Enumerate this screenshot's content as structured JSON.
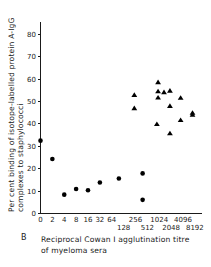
{
  "panel": {
    "label": "B"
  },
  "chart_data": {
    "type": "scatter",
    "title": "",
    "panel_label": "B",
    "xlabel": "Reciprocal Cowan I agglutination titre of myeloma sera",
    "xlabel_line1": "Reciprocal Cowan I agglutination titre",
    "xlabel_line2": "of myeloma sera",
    "ylabel": "Per cent binding of isotope-labelled protein A-IgG complexes to staphylococci",
    "ylabel_line1": "Per cent binding of isotope-labelled protein A-IgG",
    "ylabel_line2": "complexes to staphylococci",
    "grid": false,
    "legend": "none",
    "ylim": [
      0,
      85
    ],
    "yticks": [
      0,
      10,
      20,
      30,
      40,
      50,
      60,
      70,
      80
    ],
    "ytick_labels": [
      "0",
      "10",
      "20",
      "30",
      "40",
      "50",
      "60",
      "70",
      "80"
    ],
    "x_scale": "log2-category",
    "xticks_index": [
      0,
      1,
      2,
      3,
      4,
      5,
      6,
      7,
      8,
      9,
      10,
      11,
      12,
      13
    ],
    "xtick_labels": [
      "0",
      "2",
      "4",
      "8",
      "16",
      "32",
      "64",
      "128",
      "256",
      "512",
      "1024",
      "2048",
      "4096",
      "8192"
    ],
    "xtick_rows": [
      "top",
      "top",
      "top",
      "top",
      "top",
      "top",
      "top",
      "bottom",
      "top",
      "bottom",
      "top",
      "bottom",
      "top",
      "bottom"
    ],
    "marker_colors": {
      "circle": "#000000",
      "triangle": "#000000"
    },
    "series": [
      {
        "name": "circles",
        "marker": "circle",
        "values": [
          {
            "x_index": 0,
            "x_label": "0",
            "y": 32.5
          },
          {
            "x_index": 1,
            "x_label": "2",
            "y": 24.3
          },
          {
            "x_index": 2,
            "x_label": "4",
            "y": 8.4
          },
          {
            "x_index": 3,
            "x_label": "8",
            "y": 10.9
          },
          {
            "x_index": 4,
            "x_label": "16",
            "y": 10.4
          },
          {
            "x_index": 5,
            "x_label": "32",
            "y": 13.8
          },
          {
            "x_index": 6.6,
            "x_label": "128",
            "y": 15.6
          },
          {
            "x_index": 8.6,
            "x_label": "512",
            "y": 17.9
          },
          {
            "x_index": 8.6,
            "x_label": "512",
            "y": 6.1
          }
        ]
      },
      {
        "name": "triangles",
        "marker": "triangle",
        "values": [
          {
            "x_index": 7.9,
            "x_label": "256",
            "y": 52.8
          },
          {
            "x_index": 7.9,
            "x_label": "256",
            "y": 46.9
          },
          {
            "x_index": 9.9,
            "x_label": "1024",
            "y": 58.5
          },
          {
            "x_index": 9.9,
            "x_label": "1024",
            "y": 54.4
          },
          {
            "x_index": 9.9,
            "x_label": "1024",
            "y": 51.6
          },
          {
            "x_index": 10.4,
            "x_label": "1448",
            "y": 54.0
          },
          {
            "x_index": 9.8,
            "x_label": "1024",
            "y": 39.8
          },
          {
            "x_index": 10.9,
            "x_label": "2048",
            "y": 54.7
          },
          {
            "x_index": 10.9,
            "x_label": "2048",
            "y": 47.9
          },
          {
            "x_index": 10.9,
            "x_label": "2048",
            "y": 35.7
          },
          {
            "x_index": 11.8,
            "x_label": "4096",
            "y": 51.5
          },
          {
            "x_index": 11.8,
            "x_label": "4096",
            "y": 41.6
          },
          {
            "x_index": 12.8,
            "x_label": "8192",
            "y": 44.8
          },
          {
            "x_index": 12.8,
            "x_label": "8192",
            "y": 43.9
          }
        ]
      }
    ]
  }
}
